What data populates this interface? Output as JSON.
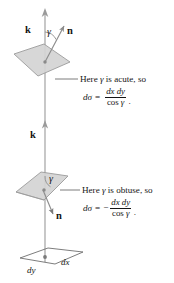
{
  "figure": {
    "background_color": "#ffffff",
    "patch_fill_color": "#d4d4d4",
    "patch_stroke_color": "#8a8a8a",
    "line_color": "#6e6e6e",
    "text_color": "#141414"
  },
  "upper": {
    "k_label": "k",
    "gamma_label": "γ",
    "n_label": "n",
    "callout_text_before": "Here ",
    "callout_gamma": "γ",
    "callout_text_after": " is acute, so",
    "formula": {
      "lhs": "dσ",
      "equals": "=",
      "sign": "",
      "numerator": "dx dy",
      "denominator_prefix": "cos ",
      "denominator_gamma": "γ",
      "trailing": "."
    }
  },
  "middle": {
    "k_label": "k"
  },
  "lower": {
    "gamma_label": "γ",
    "n_label": "n",
    "callout_text_before": "Here ",
    "callout_gamma": "γ",
    "callout_text_after": " is obtuse, so",
    "formula": {
      "lhs": "dσ",
      "equals": "=",
      "sign": "−",
      "numerator": "dx dy",
      "denominator_prefix": "cos ",
      "denominator_gamma": "γ",
      "trailing": "."
    }
  },
  "base": {
    "dy_label": "dy",
    "dx_label": "dx"
  }
}
